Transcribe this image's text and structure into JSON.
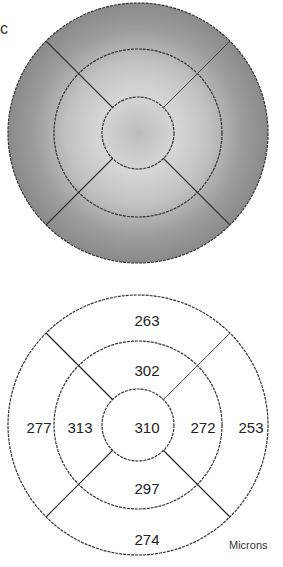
{
  "figure": {
    "panel_label": "c",
    "units": "Microns"
  },
  "thickness_map": {
    "center": "310",
    "inner_superior": "302",
    "inner_nasal": "313",
    "inner_temporal": "272",
    "inner_inferior": "297",
    "outer_superior": "263",
    "outer_nasal": "277",
    "outer_temporal": "253",
    "outer_inferior": "274"
  },
  "colors": {
    "map_fill_outer": "#8e8e8e",
    "map_fill_inner": "#c4c4c4",
    "grid_line": "#333333"
  }
}
